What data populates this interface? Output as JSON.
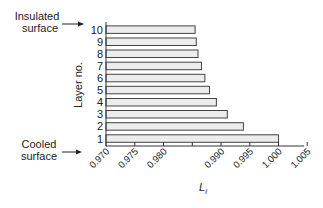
{
  "chart_data": {
    "type": "bar",
    "orientation": "horizontal",
    "title": "",
    "xlabel": "L",
    "xlabel_subscript": "i",
    "ylabel": "Layer no.",
    "categories": [
      "1",
      "2",
      "3",
      "4",
      "5",
      "6",
      "7",
      "8",
      "9",
      "10"
    ],
    "values": [
      1.0,
      0.9939,
      0.9911,
      0.9892,
      0.988,
      0.9872,
      0.9866,
      0.986,
      0.9857,
      0.9855
    ],
    "xlim": [
      0.97,
      1.005
    ],
    "xticks": [
      0.97,
      0.975,
      0.98,
      0.985,
      0.99,
      0.995,
      1.0,
      1.005
    ],
    "xtick_labels": [
      "0.970",
      "0.975",
      "0.980",
      "",
      "0.990",
      "0.995",
      "1.000",
      "1.005"
    ],
    "grid": false,
    "legend": null,
    "annotations": [
      {
        "text_lines": [
          "Insulated",
          "surface"
        ],
        "points_to": "10"
      },
      {
        "text_lines": [
          "Cooled",
          "surface"
        ],
        "points_to": "1"
      }
    ],
    "bar_fill": "#ececec",
    "bar_stroke": "#444444"
  }
}
